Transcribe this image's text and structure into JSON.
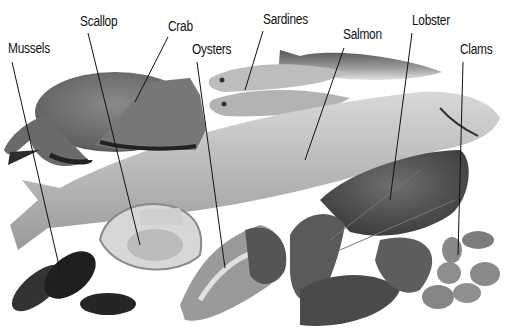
{
  "diagram": {
    "type": "labeled-photo",
    "labels": [
      {
        "id": "mussels",
        "text": "Mussels",
        "x": 8,
        "y": 40,
        "line": [
          12,
          62,
          60,
          270
        ]
      },
      {
        "id": "scallop",
        "text": "Scallop",
        "x": 80,
        "y": 13,
        "line": [
          88,
          33,
          140,
          245
        ]
      },
      {
        "id": "crab",
        "text": "Crab",
        "x": 168,
        "y": 18,
        "line": [
          168,
          37,
          135,
          102
        ]
      },
      {
        "id": "oysters",
        "text": "Oysters",
        "x": 192,
        "y": 41,
        "line": [
          197,
          62,
          225,
          268
        ]
      },
      {
        "id": "sardines",
        "text": "Sardines",
        "x": 263,
        "y": 11,
        "line": [
          263,
          31,
          245,
          90
        ]
      },
      {
        "id": "salmon",
        "text": "Salmon",
        "x": 343,
        "y": 26,
        "line": [
          344,
          48,
          305,
          160
        ]
      },
      {
        "id": "lobster",
        "text": "Lobster",
        "x": 412,
        "y": 12,
        "line": [
          412,
          33,
          390,
          200
        ]
      },
      {
        "id": "clams",
        "text": "Clams",
        "x": 460,
        "y": 41,
        "line": [
          463,
          62,
          458,
          255
        ]
      }
    ]
  }
}
